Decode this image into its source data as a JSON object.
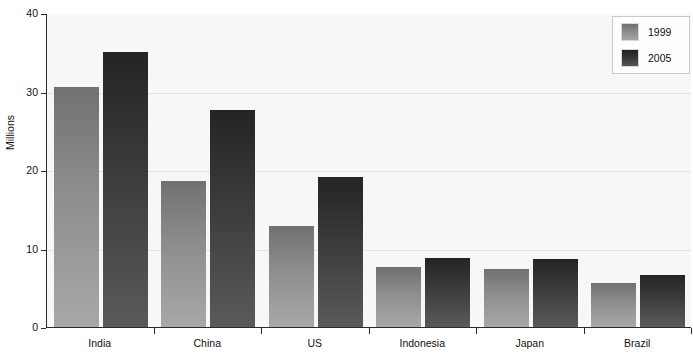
{
  "chart_data": {
    "type": "bar",
    "title": "",
    "subtitle": "",
    "xlabel": "",
    "ylabel": "Millions",
    "ylim": [
      0,
      40
    ],
    "yticks": [
      0,
      10,
      20,
      30,
      40
    ],
    "ytick_labels": [
      "0",
      "10",
      "20",
      "30",
      "40"
    ],
    "grid": true,
    "legend_position": "top-right",
    "categories": [
      "India",
      "China",
      "US",
      "Indonesia",
      "Japan",
      "Brazil"
    ],
    "series": [
      {
        "name": "1999",
        "color": "#8e8e8e",
        "values": [
          30.6,
          18.6,
          12.9,
          7.6,
          7.4,
          5.6
        ]
      },
      {
        "name": "2005",
        "color": "#3c3c3c",
        "values": [
          35.0,
          27.7,
          19.1,
          8.8,
          8.7,
          6.6
        ]
      }
    ]
  },
  "legend": {
    "entries": [
      {
        "label": "1999",
        "swatch": "legend-swatch-1999"
      },
      {
        "label": "2005",
        "swatch": "legend-swatch-2005"
      }
    ]
  },
  "axis": {
    "y_title": "Millions"
  },
  "caption": {
    "text": ""
  },
  "colors": {
    "plot_background": "#f7f7f7",
    "axis_line": "#2b2b2b",
    "gridline": "#e2e2e2",
    "series_1999_top": "#717171",
    "series_1999_bottom": "#a8a8a8",
    "series_2005_top": "#242424",
    "series_2005_bottom": "#5a5a5a"
  }
}
